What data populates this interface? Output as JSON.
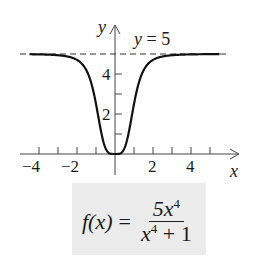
{
  "chart_data": {
    "type": "line",
    "title": "",
    "xlabel": "x",
    "ylabel": "y",
    "xlim": [
      -4.5,
      5.5
    ],
    "ylim": [
      -0.5,
      6
    ],
    "x_ticks": [
      -4,
      -3,
      -2,
      -1,
      1,
      2,
      3,
      4,
      5
    ],
    "x_tick_labels": [
      "-4",
      "-2",
      "2",
      "4"
    ],
    "y_ticks": [
      1,
      2,
      3,
      4,
      5
    ],
    "y_tick_labels": [
      "2",
      "4"
    ],
    "grid": false,
    "series": [
      {
        "name": "f(x) = 5x^4/(x^4+1)",
        "function": "5*x^4/(x^4+1)",
        "style": "solid",
        "x": [
          -4.5,
          -3,
          -2,
          -1.5,
          -1,
          -0.5,
          0,
          0.5,
          1,
          1.5,
          2,
          3,
          5.5
        ],
        "y": [
          4.99,
          4.94,
          4.71,
          4.18,
          2.5,
          0.29,
          0,
          0.29,
          2.5,
          4.18,
          4.71,
          4.94,
          5.0
        ]
      },
      {
        "name": "asymptote",
        "style": "dashed",
        "x": [
          -4.5,
          5.5
        ],
        "y": [
          5,
          5
        ]
      }
    ],
    "annotations": [
      {
        "text": "y = 5",
        "x": 1.5,
        "y": 5.4
      }
    ]
  },
  "labels": {
    "y_axis": "y",
    "x_axis": "x",
    "asymptote": "y = 5",
    "xtick_m4": "−4",
    "xtick_m2": "−2",
    "xtick_2": "2",
    "xtick_4": "4",
    "ytick_2": "2",
    "ytick_4": "4"
  },
  "formula": {
    "lhs": "f(x)",
    "eq": "=",
    "num_coef": "5x",
    "num_exp": "4",
    "den_var": "x",
    "den_exp": "4",
    "den_rest": " + 1"
  }
}
